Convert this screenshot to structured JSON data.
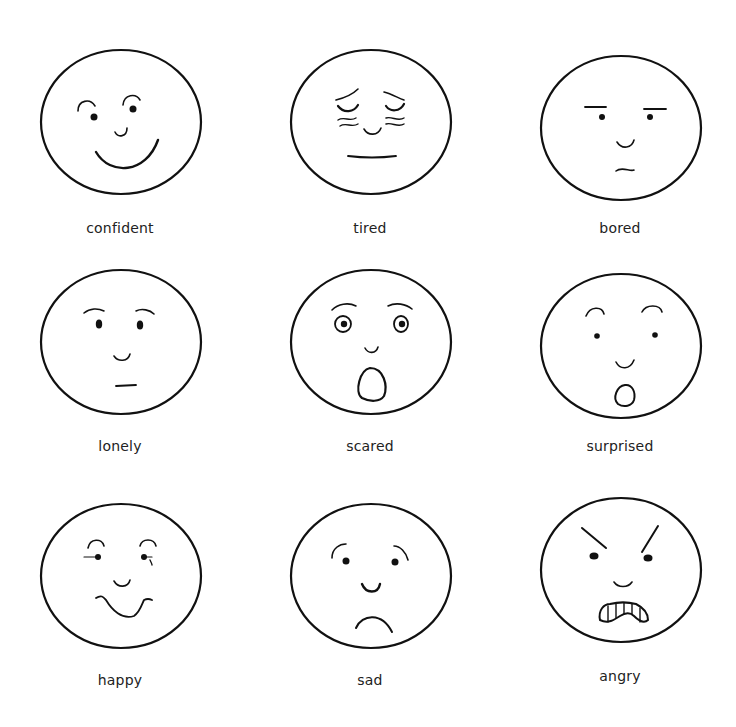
{
  "colors": {
    "line": "#111111",
    "background": "#ffffff",
    "label": "#222222"
  },
  "faces": [
    {
      "id": "confident",
      "label": "confident",
      "row": 1,
      "col": 1
    },
    {
      "id": "tired",
      "label": "tired",
      "row": 1,
      "col": 2
    },
    {
      "id": "bored",
      "label": "bored",
      "row": 1,
      "col": 3
    },
    {
      "id": "lonely",
      "label": "lonely",
      "row": 2,
      "col": 1
    },
    {
      "id": "scared",
      "label": "scared",
      "row": 2,
      "col": 2
    },
    {
      "id": "surprised",
      "label": "surprised",
      "row": 2,
      "col": 3
    },
    {
      "id": "happy",
      "label": "happy",
      "row": 3,
      "col": 1
    },
    {
      "id": "sad",
      "label": "sad",
      "row": 3,
      "col": 2
    },
    {
      "id": "angry",
      "label": "angry",
      "row": 3,
      "col": 3
    }
  ]
}
